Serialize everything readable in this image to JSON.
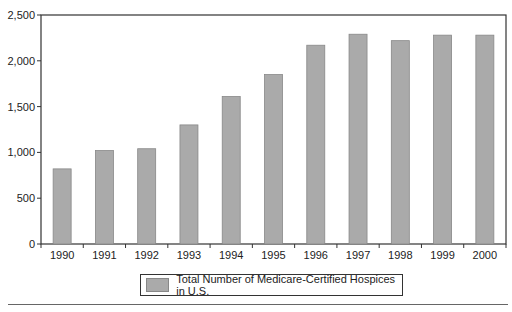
{
  "chart_data": {
    "type": "bar",
    "title": "",
    "xlabel": "",
    "ylabel": "",
    "categories": [
      "1990",
      "1991",
      "1992",
      "1993",
      "1994",
      "1995",
      "1996",
      "1997",
      "1998",
      "1999",
      "2000"
    ],
    "values": [
      820,
      1020,
      1040,
      1300,
      1610,
      1850,
      2170,
      2290,
      2220,
      2280,
      2280
    ],
    "series": [
      {
        "name": "Total Number of Medicare-Certified Hospices in U.S.",
        "values": [
          820,
          1020,
          1040,
          1300,
          1610,
          1850,
          2170,
          2290,
          2220,
          2280,
          2280
        ]
      }
    ],
    "ylim": [
      0,
      2500
    ],
    "yticks": [
      "0",
      "500",
      "1,000",
      "1,500",
      "2,000",
      "2,500"
    ],
    "grid": false,
    "legend_position": "bottom",
    "bar_color": "#aaaaaa"
  },
  "legend": {
    "label": "Total Number of Medicare-Certified Hospices in U.S."
  }
}
